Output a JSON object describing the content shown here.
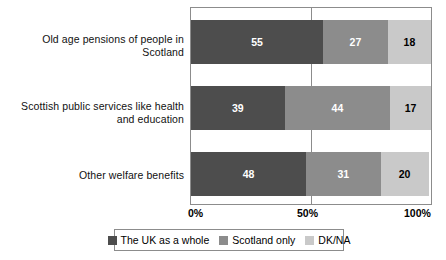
{
  "chart_data": {
    "type": "bar",
    "orientation": "horizontal",
    "stacked": true,
    "normalized": true,
    "title": "",
    "xlabel": "",
    "ylabel": "",
    "xlim": [
      0,
      100
    ],
    "grid": true,
    "gridlines": [
      50
    ],
    "legend_position": "bottom",
    "categories": [
      "Old age pensions of people in Scotland",
      "Scottish public services like health and education",
      "Other welfare benefits"
    ],
    "xticks": [
      "0%",
      "50%",
      "100%"
    ],
    "xtick_values": [
      0,
      50,
      100
    ],
    "series": [
      {
        "name": "The UK as a whole",
        "color": "#4d4d4d",
        "label_color": "#ffffff",
        "values": [
          55,
          39,
          48
        ]
      },
      {
        "name": "Scotland only",
        "color": "#8c8c8c",
        "label_color": "#ffffff",
        "values": [
          27,
          44,
          31
        ]
      },
      {
        "name": "DK/NA",
        "color": "#c9c9c9",
        "label_color": "#000000",
        "values": [
          18,
          17,
          20
        ]
      }
    ]
  },
  "legend": {
    "items": [
      {
        "label": "The UK as a whole",
        "color": "#4d4d4d"
      },
      {
        "label": "Scotland only",
        "color": "#8c8c8c"
      },
      {
        "label": "DK/NA",
        "color": "#c9c9c9"
      }
    ]
  },
  "axis": {
    "ticks": [
      {
        "label": "0%"
      },
      {
        "label": "50%"
      },
      {
        "label": "100%"
      }
    ]
  }
}
